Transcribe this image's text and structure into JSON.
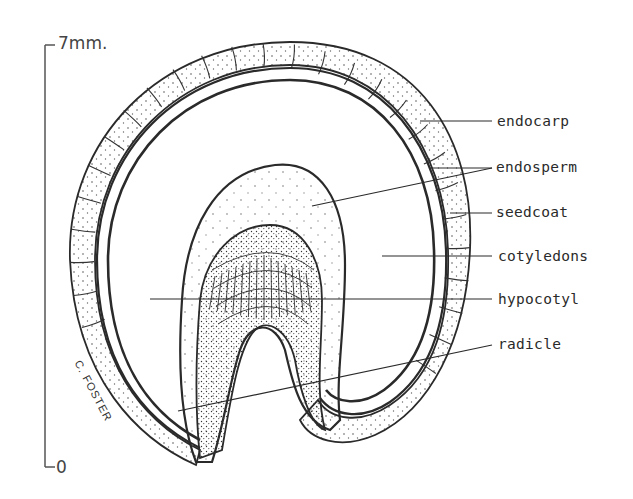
{
  "figure": {
    "scale_bar": {
      "top_label": "7mm.",
      "bottom_label": "0"
    },
    "labels": [
      {
        "id": "endocarp",
        "text": "endocarp"
      },
      {
        "id": "endosperm",
        "text": "endosperm"
      },
      {
        "id": "seedcoat",
        "text": "seedcoat"
      },
      {
        "id": "cotyledons",
        "text": "cotyledons"
      },
      {
        "id": "hypocotyl",
        "text": "hypocotyl"
      },
      {
        "id": "radicle",
        "text": "radicle"
      }
    ],
    "signature": "C. FOSTER",
    "colors": {
      "ink": "#2a2a2a",
      "paper": "#ffffff"
    }
  }
}
